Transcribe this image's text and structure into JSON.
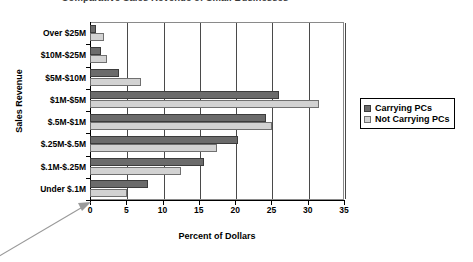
{
  "chart_data": {
    "type": "bar",
    "orientation": "horizontal",
    "title": "Comparative Sales Revenue of Small Businesses",
    "xlabel": "Percent of Dollars",
    "ylabel": "Sales Revenue",
    "xlim": [
      0,
      35
    ],
    "xticks": [
      0,
      5,
      10,
      15,
      20,
      25,
      30,
      35
    ],
    "grid": true,
    "legend_position": "right",
    "categories": [
      "Over $25M",
      "$10M-$25M",
      "$5M-$10M",
      "$1M-$5M",
      "$.5M-$1M",
      "$.25M-$.5M",
      "$.1M-$.25M",
      "Under $.1M"
    ],
    "series": [
      {
        "name": "Carrying PCs",
        "color": "#6b6b6b",
        "values": [
          0.8,
          1.5,
          4.0,
          26.0,
          24.3,
          20.4,
          15.7,
          8.0
        ]
      },
      {
        "name": "Not Carrying PCs",
        "color": "#d2d2d2",
        "values": [
          1.9,
          2.4,
          7.0,
          31.5,
          25.1,
          17.5,
          12.5,
          5.1
        ]
      }
    ],
    "annotations": [
      {
        "name": "origin-pointer-arrow",
        "target": "x-axis origin (0)"
      }
    ]
  }
}
